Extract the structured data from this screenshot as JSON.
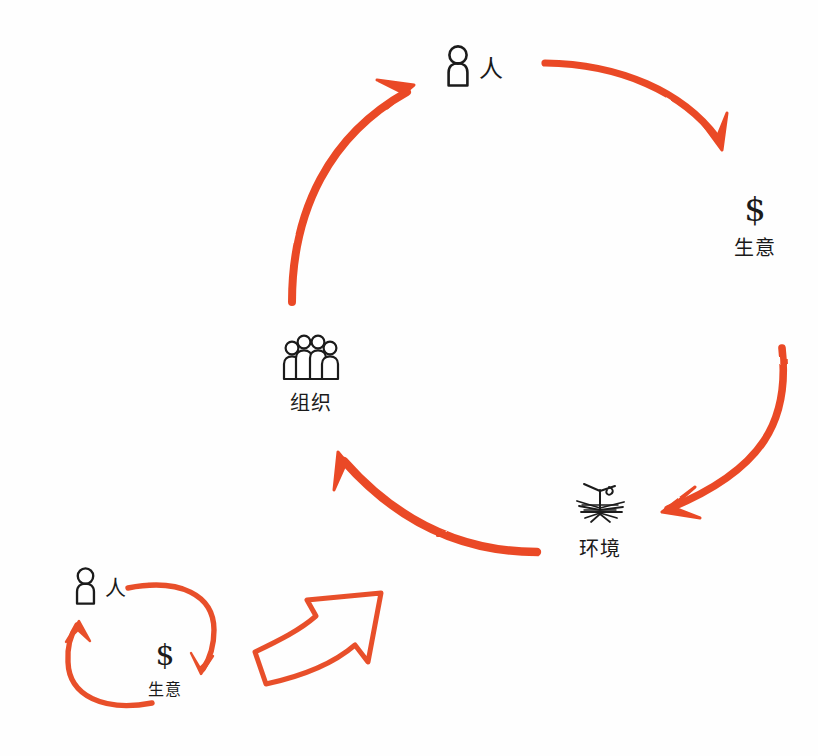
{
  "diagram": {
    "style": "hand-drawn whiteboard sketch",
    "background_color": "#fefefe",
    "ink_color": "#1b1b1b",
    "arrow_color": "#ea4a26",
    "arrow_color_light": "#e8502c"
  },
  "nodes": [
    {
      "id": "person-top",
      "icon": "person-icon",
      "label": "人",
      "meaning": "person",
      "position": "top-center"
    },
    {
      "id": "business-right",
      "icon": "dollar-icon",
      "symbol": "$",
      "label": "生意",
      "meaning": "business",
      "position": "right"
    },
    {
      "id": "environment-bottom-right",
      "icon": "tree-icon",
      "label": "环境",
      "meaning": "environment",
      "position": "bottom-right"
    },
    {
      "id": "organization-center",
      "icon": "people-group-icon",
      "label": "组织",
      "meaning": "organization",
      "position": "center-left"
    }
  ],
  "sub_cycle": {
    "id": "sub-cycle-bottom-left",
    "nodes": [
      {
        "id": "person-sub",
        "icon": "person-icon",
        "label": "人",
        "meaning": "person"
      },
      {
        "id": "business-sub",
        "icon": "dollar-icon",
        "symbol": "$",
        "label": "生意",
        "meaning": "business"
      }
    ],
    "arrows": [
      {
        "id": "sub-arrow-right",
        "from": "person-sub",
        "to": "business-sub",
        "style": "solid-curved"
      },
      {
        "id": "sub-arrow-left",
        "from": "business-sub",
        "to": "person-sub",
        "style": "solid-curved"
      }
    ]
  },
  "arrows": [
    {
      "id": "arrow-person-to-business",
      "from": "person-top",
      "to": "business-right",
      "style": "solid-curved-filled"
    },
    {
      "id": "arrow-business-to-environment",
      "from": "business-right",
      "to": "environment-bottom-right",
      "style": "solid-curved-filled"
    },
    {
      "id": "arrow-environment-to-organization",
      "from": "environment-bottom-right",
      "to": "organization-center",
      "style": "solid-curved-filled"
    },
    {
      "id": "arrow-organization-to-person",
      "from": "organization-center",
      "to": "person-top",
      "style": "solid-curved-filled"
    },
    {
      "id": "arrow-subcycle-to-main",
      "from": "sub-cycle-bottom-left",
      "to": "arrow-environment-to-organization",
      "style": "hollow-block-arrow"
    }
  ]
}
